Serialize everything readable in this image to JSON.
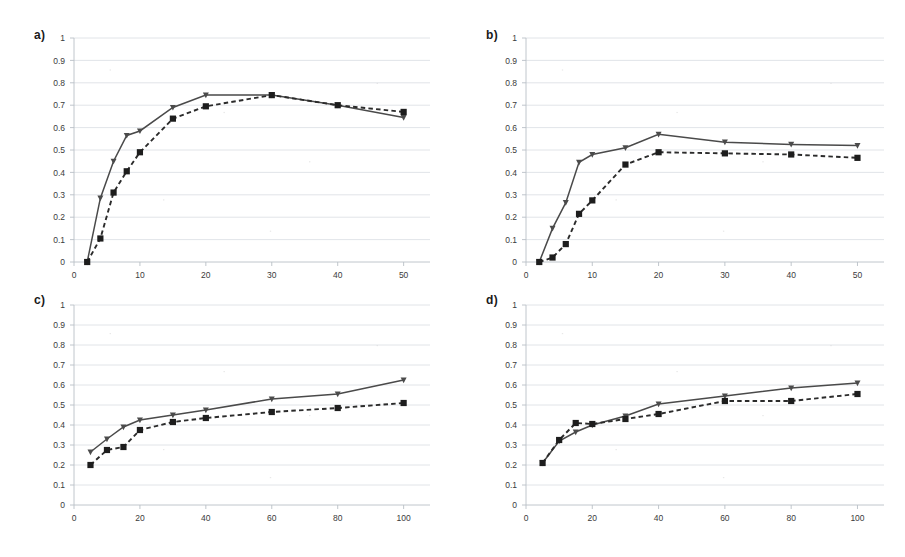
{
  "figure": {
    "background": "#ffffff",
    "grid": true,
    "panel_count": 4,
    "solid_color": "#4a4a4a",
    "dashed_color": "#1d1d1d"
  },
  "panels": {
    "a": {
      "label": "a)"
    },
    "b": {
      "label": "b)"
    },
    "c": {
      "label": "c)"
    },
    "d": {
      "label": "d)"
    }
  },
  "axes": {
    "ylabels": [
      "0",
      "0.1",
      "0.2",
      "0.3",
      "0.4",
      "0.5",
      "0.6",
      "0.7",
      "0.8",
      "0.9",
      "1"
    ],
    "xlabels_ab": [
      "0",
      "10",
      "20",
      "30",
      "40",
      "50"
    ],
    "xlabels_cd": [
      "0",
      "20",
      "40",
      "60",
      "80",
      "100"
    ]
  },
  "chart_data": [
    {
      "type": "line",
      "title": "a)",
      "xlabel": "",
      "ylabel": "",
      "xlim": [
        0,
        54
      ],
      "ylim": [
        0,
        1
      ],
      "xticks": [
        0,
        10,
        20,
        30,
        40,
        50
      ],
      "yticks": [
        0,
        0.1,
        0.2,
        0.3,
        0.4,
        0.5,
        0.6,
        0.7,
        0.8,
        0.9,
        1
      ],
      "grid": true,
      "legend": "none",
      "series": [
        {
          "name": "solid-triangle",
          "style": "solid",
          "marker": "triangle",
          "x": [
            2,
            4,
            6,
            8,
            10,
            15,
            20,
            30,
            40,
            50
          ],
          "y": [
            0.0,
            0.285,
            0.45,
            0.565,
            0.585,
            0.69,
            0.745,
            0.745,
            0.7,
            0.645
          ]
        },
        {
          "name": "dashed-square",
          "style": "dashed",
          "marker": "square",
          "x": [
            2,
            4,
            6,
            8,
            10,
            15,
            20,
            30,
            40,
            50
          ],
          "y": [
            0.0,
            0.105,
            0.31,
            0.405,
            0.49,
            0.64,
            0.695,
            0.745,
            0.7,
            0.67
          ]
        }
      ]
    },
    {
      "type": "line",
      "title": "b)",
      "xlabel": "",
      "ylabel": "",
      "xlim": [
        0,
        54
      ],
      "ylim": [
        0,
        1
      ],
      "xticks": [
        0,
        10,
        20,
        30,
        40,
        50
      ],
      "yticks": [
        0,
        0.1,
        0.2,
        0.3,
        0.4,
        0.5,
        0.6,
        0.7,
        0.8,
        0.9,
        1
      ],
      "grid": true,
      "legend": "none",
      "series": [
        {
          "name": "solid-triangle",
          "style": "solid",
          "marker": "triangle",
          "x": [
            2,
            4,
            6,
            8,
            10,
            15,
            20,
            30,
            40,
            50
          ],
          "y": [
            0.0,
            0.15,
            0.265,
            0.445,
            0.48,
            0.51,
            0.57,
            0.535,
            0.525,
            0.52
          ]
        },
        {
          "name": "dashed-square",
          "style": "dashed",
          "marker": "square",
          "x": [
            2,
            4,
            6,
            8,
            10,
            15,
            20,
            30,
            40,
            50
          ],
          "y": [
            0.0,
            0.02,
            0.08,
            0.215,
            0.275,
            0.435,
            0.49,
            0.485,
            0.48,
            0.465
          ]
        }
      ]
    },
    {
      "type": "line",
      "title": "c)",
      "xlabel": "",
      "ylabel": "",
      "xlim": [
        0,
        108
      ],
      "ylim": [
        0,
        1
      ],
      "xticks": [
        0,
        20,
        40,
        60,
        80,
        100
      ],
      "yticks": [
        0,
        0.1,
        0.2,
        0.3,
        0.4,
        0.5,
        0.6,
        0.7,
        0.8,
        0.9,
        1
      ],
      "grid": true,
      "legend": "none",
      "series": [
        {
          "name": "solid-triangle",
          "style": "solid",
          "marker": "triangle",
          "x": [
            5,
            10,
            15,
            20,
            30,
            40,
            60,
            80,
            100
          ],
          "y": [
            0.265,
            0.33,
            0.39,
            0.425,
            0.45,
            0.475,
            0.53,
            0.555,
            0.625
          ]
        },
        {
          "name": "dashed-square",
          "style": "dashed",
          "marker": "square",
          "x": [
            5,
            10,
            15,
            20,
            30,
            40,
            60,
            80,
            100
          ],
          "y": [
            0.2,
            0.275,
            0.29,
            0.375,
            0.415,
            0.435,
            0.465,
            0.485,
            0.51
          ]
        }
      ]
    },
    {
      "type": "line",
      "title": "d)",
      "xlabel": "",
      "ylabel": "",
      "xlim": [
        0,
        108
      ],
      "ylim": [
        0,
        1
      ],
      "xticks": [
        0,
        20,
        40,
        60,
        80,
        100
      ],
      "yticks": [
        0,
        0.1,
        0.2,
        0.3,
        0.4,
        0.5,
        0.6,
        0.7,
        0.8,
        0.9,
        1
      ],
      "grid": true,
      "legend": "none",
      "series": [
        {
          "name": "solid-triangle",
          "style": "solid",
          "marker": "triangle",
          "x": [
            5,
            10,
            15,
            20,
            30,
            40,
            60,
            80,
            100
          ],
          "y": [
            0.21,
            0.32,
            0.365,
            0.4,
            0.445,
            0.505,
            0.545,
            0.585,
            0.61
          ]
        },
        {
          "name": "dashed-square",
          "style": "dashed",
          "marker": "square",
          "x": [
            5,
            10,
            15,
            20,
            30,
            40,
            60,
            80,
            100
          ],
          "y": [
            0.21,
            0.325,
            0.41,
            0.405,
            0.43,
            0.455,
            0.52,
            0.52,
            0.555
          ]
        }
      ]
    }
  ]
}
